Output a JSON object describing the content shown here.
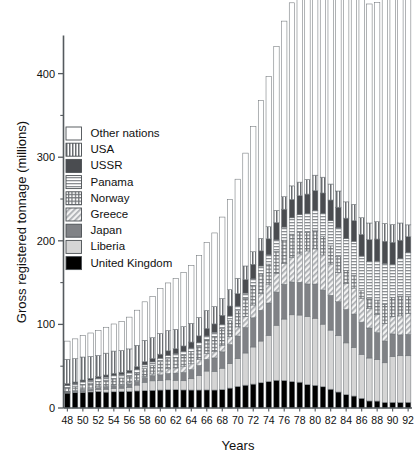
{
  "chart_data": {
    "type": "bar",
    "stacked": true,
    "title": "",
    "xlabel": "Years",
    "ylabel": "Gross registered tonnage (millions)",
    "xlim": [
      47,
      93
    ],
    "ylim": [
      0,
      445
    ],
    "yticks": [
      0,
      100,
      200,
      300,
      400
    ],
    "yticks_minor": [
      50,
      150,
      250,
      350,
      400
    ],
    "ytick_labels": [
      "0",
      "100",
      "200",
      "300",
      "400"
    ],
    "grid": false,
    "legend_position": "upper-left-inside",
    "categories": [
      48,
      49,
      50,
      51,
      52,
      53,
      54,
      55,
      56,
      57,
      58,
      59,
      60,
      61,
      62,
      63,
      64,
      65,
      66,
      67,
      68,
      69,
      70,
      71,
      72,
      73,
      74,
      75,
      76,
      77,
      78,
      79,
      80,
      81,
      82,
      83,
      84,
      85,
      86,
      87,
      88,
      89,
      90,
      91,
      92
    ],
    "xtick_labels": [
      "48",
      "50",
      "52",
      "54",
      "56",
      "58",
      "60",
      "62",
      "64",
      "66",
      "68",
      "70",
      "72",
      "74",
      "76",
      "78",
      "80",
      "82",
      "84",
      "86",
      "88",
      "90",
      "92"
    ],
    "series": [
      {
        "name": "United Kingdom",
        "pattern": "solid-black",
        "color": "#000000",
        "values": [
          18.0,
          18.4,
          18.8,
          19.2,
          19.8,
          19.0,
          19.4,
          19.7,
          19.9,
          20.4,
          20.7,
          21.2,
          21.5,
          21.8,
          21.9,
          21.6,
          21.5,
          21.5,
          21.6,
          21.5,
          21.9,
          23.8,
          25.8,
          27.3,
          28.6,
          30.2,
          31.6,
          33.2,
          32.9,
          31.6,
          30.9,
          27.9,
          27.1,
          25.4,
          22.5,
          19.1,
          15.9,
          14.3,
          11.6,
          8.4,
          8.3,
          6.7,
          6.8,
          6.6,
          6.8
        ]
      },
      {
        "name": "Liberia",
        "pattern": "solid-lightgray",
        "color": "#d5d5d5",
        "values": [
          0.2,
          0.5,
          0.8,
          1.4,
          2.4,
          3.5,
          3.9,
          4.0,
          4.9,
          7.0,
          10.1,
          11.3,
          11.3,
          11.9,
          11.3,
          11.0,
          13.5,
          17.5,
          22.6,
          22.4,
          25.7,
          29.2,
          33.3,
          38.5,
          44.4,
          49.9,
          55.3,
          65.8,
          73.5,
          79.9,
          80.3,
          81.5,
          80.3,
          74.9,
          70.7,
          67.6,
          62.0,
          58.2,
          52.6,
          51.4,
          49.7,
          47.4,
          54.7,
          55.9,
          55.7
        ]
      },
      {
        "name": "Japan",
        "pattern": "solid-midgray",
        "color": "#808286",
        "values": [
          1.1,
          1.2,
          1.5,
          1.7,
          2.0,
          2.4,
          2.9,
          3.4,
          3.9,
          4.4,
          5.5,
          6.1,
          6.9,
          7.6,
          8.6,
          9.9,
          10.8,
          11.9,
          14.0,
          16.0,
          19.6,
          23.0,
          27.0,
          30.5,
          34.9,
          36.8,
          38.7,
          39.7,
          41.6,
          39.2,
          39.2,
          39.0,
          40.9,
          40.8,
          41.6,
          40.4,
          39.9,
          39.9,
          38.5,
          35.9,
          32.1,
          26.0,
          27.1,
          25.0,
          25.5
        ]
      },
      {
        "name": "Greece",
        "pattern": "diagonal-hatch",
        "color": "#cfcfcf",
        "values": [
          0.5,
          0.8,
          1.3,
          1.5,
          1.3,
          1.3,
          1.3,
          1.3,
          1.4,
          1.5,
          1.6,
          2.2,
          4.5,
          5.6,
          6.1,
          6.9,
          7.1,
          7.1,
          7.3,
          7.4,
          8.0,
          9.3,
          10.9,
          13.1,
          15.3,
          19.8,
          21.8,
          22.5,
          25.0,
          29.5,
          34.0,
          39.5,
          42.0,
          42.0,
          37.5,
          35.0,
          31.0,
          31.0,
          28.4,
          23.5,
          21.9,
          21.3,
          20.5,
          22.7,
          25.2
        ]
      },
      {
        "name": "Norway",
        "pattern": "crosshatch",
        "color": "#c9c9c9",
        "values": [
          4.3,
          4.8,
          5.5,
          5.9,
          6.2,
          6.9,
          7.2,
          7.6,
          7.9,
          8.5,
          9.4,
          10.0,
          11.2,
          11.9,
          12.8,
          13.7,
          14.4,
          15.6,
          16.0,
          18.4,
          19.7,
          19.3,
          19.3,
          21.7,
          23.5,
          23.6,
          24.8,
          26.2,
          27.8,
          27.8,
          26.1,
          22.3,
          21.7,
          21.9,
          21.7,
          19.2,
          16.0,
          15.3,
          9.3,
          11.4,
          17.2,
          22.6,
          23.4,
          23.6,
          20.3
        ]
      },
      {
        "name": "Panama",
        "pattern": "horizontal-stripes",
        "color": "#dcdcdc",
        "values": [
          2.9,
          3.2,
          3.3,
          3.4,
          3.5,
          3.8,
          4.1,
          3.9,
          4.0,
          4.2,
          4.3,
          4.3,
          4.2,
          4.2,
          4.3,
          4.5,
          4.4,
          4.5,
          4.7,
          4.9,
          5.0,
          5.4,
          5.6,
          6.3,
          7.8,
          9.5,
          11.0,
          13.7,
          15.6,
          19.5,
          20.7,
          22.3,
          24.2,
          27.7,
          30.0,
          34.2,
          37.8,
          40.7,
          41.3,
          44.6,
          46.6,
          48.8,
          39.3,
          44.9,
          52.4
        ]
      },
      {
        "name": "USSR",
        "pattern": "solid-darkgray",
        "color": "#4a4c50",
        "values": [
          2.1,
          2.2,
          2.3,
          2.4,
          2.5,
          2.6,
          2.7,
          2.9,
          3.1,
          3.4,
          3.8,
          4.2,
          4.8,
          5.4,
          5.9,
          6.6,
          7.2,
          8.2,
          9.0,
          10.0,
          11.0,
          12.0,
          14.8,
          16.2,
          17.4,
          18.2,
          19.2,
          20.7,
          21.4,
          22.0,
          22.8,
          23.4,
          23.8,
          24.5,
          24.8,
          24.7,
          24.5,
          24.7,
          26.0,
          26.1,
          26.3,
          26.7,
          26.4,
          22.0,
          19.1
        ]
      },
      {
        "name": "USA",
        "pattern": "vertical-stripes",
        "color": "#b9b9b9",
        "values": [
          29.2,
          28.0,
          27.5,
          26.2,
          25.2,
          26.1,
          26.6,
          26.0,
          25.6,
          25.6,
          25.6,
          24.8,
          24.8,
          24.2,
          23.2,
          23.1,
          22.4,
          22.0,
          21.5,
          20.8,
          20.0,
          19.6,
          18.5,
          16.3,
          15.0,
          14.9,
          14.4,
          14.6,
          15.0,
          16.2,
          16.2,
          17.5,
          18.5,
          18.9,
          19.1,
          19.4,
          19.5,
          19.5,
          19.9,
          20.0,
          20.8,
          21.3,
          21.3,
          20.6,
          14.1
        ]
      },
      {
        "name": "Other nations",
        "pattern": "blank-white",
        "color": "#ffffff",
        "values": [
          21.7,
          23.6,
          25.6,
          28.0,
          30.0,
          31.0,
          32.4,
          34.7,
          38.0,
          42.0,
          46.0,
          49.5,
          53.5,
          57.0,
          60.7,
          64.6,
          69.0,
          74.0,
          81.1,
          88.0,
          97.5,
          108.0,
          118.5,
          135.0,
          150.0,
          165.0,
          180.0,
          196.0,
          210.0,
          219.0,
          226.0,
          239.0,
          245.0,
          252.0,
          257.0,
          263.0,
          276.0,
          282.0,
          275.0,
          262.0,
          262.0,
          268.0,
          278.0,
          288.0,
          300.0
        ]
      }
    ]
  },
  "legend": {
    "entries": [
      {
        "label": "Other nations",
        "pattern": "blank-white"
      },
      {
        "label": "USA",
        "pattern": "vertical-stripes"
      },
      {
        "label": "USSR",
        "pattern": "solid-darkgray"
      },
      {
        "label": "Panama",
        "pattern": "horizontal-stripes"
      },
      {
        "label": "Norway",
        "pattern": "crosshatch"
      },
      {
        "label": "Greece",
        "pattern": "diagonal-hatch"
      },
      {
        "label": "Japan",
        "pattern": "solid-midgray"
      },
      {
        "label": "Liberia",
        "pattern": "solid-lightgray"
      },
      {
        "label": "United Kingdom",
        "pattern": "solid-black"
      }
    ]
  }
}
